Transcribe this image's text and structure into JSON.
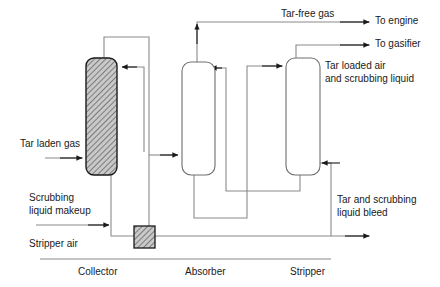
{
  "diagram": {
    "colors": {
      "line": "#808080",
      "arrow": "#1a1a1a",
      "vessel_stroke": "#1a1a1a",
      "hatch_fill": "#c8c8c8",
      "text": "#1a1a1a",
      "background": "#ffffff"
    },
    "units": [
      {
        "id": "collector",
        "label": "Collector",
        "style": "hatched"
      },
      {
        "id": "absorber",
        "label": "Absorber",
        "style": "plain"
      },
      {
        "id": "stripper",
        "label": "Stripper",
        "style": "plain"
      }
    ],
    "equipment": [
      {
        "id": "mixer",
        "label": "",
        "style": "hatched"
      }
    ],
    "stream_labels": [
      {
        "id": "tar-laden-gas",
        "text": "Tar laden gas"
      },
      {
        "id": "scrubbing-liquid-makeup",
        "text": "Scrubbing\nliquid makeup"
      },
      {
        "id": "stripper-air",
        "text": "Stripper air"
      },
      {
        "id": "tar-free-gas",
        "text": "Tar-free gas"
      },
      {
        "id": "to-engine",
        "text": "To engine"
      },
      {
        "id": "to-gasifier",
        "text": "To gasifier"
      },
      {
        "id": "tar-loaded-air",
        "text": "Tar loaded air\nand scrubbing liquid"
      },
      {
        "id": "tar-scrubbing-bleed",
        "text": "Tar and scrubbing\nliquid bleed"
      }
    ],
    "labels": {
      "tar_laden_gas": "Tar laden gas",
      "scrubbing_liquid_makeup_line1": "Scrubbing",
      "scrubbing_liquid_makeup_line2": "liquid makeup",
      "stripper_air": "Stripper air",
      "tar_free_gas": "Tar-free gas",
      "to_engine": "To engine",
      "to_gasifier": "To gasifier",
      "tar_loaded_air_line1": "Tar loaded air",
      "tar_loaded_air_line2": "and scrubbing liquid",
      "tar_bleed_line1": "Tar and scrubbing",
      "tar_bleed_line2": "liquid bleed",
      "collector": "Collector",
      "absorber": "Absorber",
      "stripper": "Stripper"
    }
  }
}
